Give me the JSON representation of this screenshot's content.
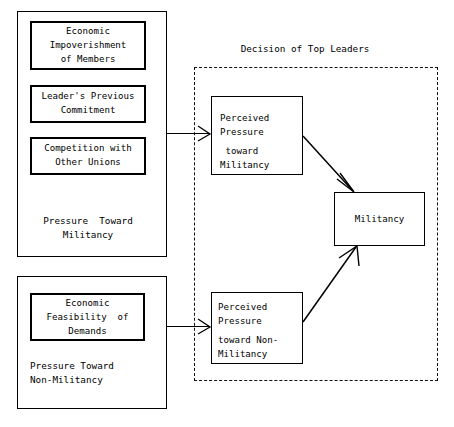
{
  "diagram": {
    "title_region": {
      "label": "Decision of Top Leaders",
      "name": "decision-of-top-leaders-caption"
    },
    "groups": [
      {
        "id": "pressure-toward-militancy-group",
        "caption_line1": "Pressure  Toward",
        "caption_line2": "Militancy",
        "items": [
          {
            "id": "economic-impoverishment-of-members",
            "lines": [
              "Economic",
              "Impoverishment",
              "of Members"
            ]
          },
          {
            "id": "leaders-previous-commitment",
            "lines": [
              "Leader's Previous",
              "Commitment"
            ]
          },
          {
            "id": "competition-with-other-unions",
            "lines": [
              "Competition with",
              "Other Unions"
            ]
          }
        ]
      },
      {
        "id": "pressure-toward-non-militancy-group",
        "caption_line1": "Pressure Toward",
        "caption_line2": "Non-Militancy",
        "items": [
          {
            "id": "economic-feasibility-of-demands",
            "lines": [
              "Economic",
              "Feasibility  of",
              "Demands"
            ]
          }
        ]
      }
    ],
    "nodes": [
      {
        "id": "perceived-pressure-toward-militancy",
        "line1": "Perceived",
        "line2": "Pressure",
        "line3": " toward",
        "line4": "Militancy"
      },
      {
        "id": "perceived-pressure-toward-non-militancy",
        "line1": "Perceived",
        "line2": "Pressure",
        "line3": "toward Non-",
        "line4": "Militancy"
      },
      {
        "id": "militancy-outcome",
        "label": "Militancy"
      }
    ],
    "arrows": [
      {
        "id": "arrow-militancy-pressure-to-perceived",
        "from": "pressure-toward-militancy-group",
        "to": "perceived-pressure-toward-militancy"
      },
      {
        "id": "arrow-non-militancy-pressure-to-perceived",
        "from": "pressure-toward-non-militancy-group",
        "to": "perceived-pressure-toward-non-militancy"
      },
      {
        "id": "arrow-perceived-militancy-to-outcome",
        "from": "perceived-pressure-toward-militancy",
        "to": "militancy-outcome"
      },
      {
        "id": "arrow-perceived-non-militancy-to-outcome",
        "from": "perceived-pressure-toward-non-militancy",
        "to": "militancy-outcome"
      }
    ],
    "colors": {
      "stroke": "#000000",
      "background": "#ffffff",
      "dashed_stroke": "#111111"
    }
  }
}
